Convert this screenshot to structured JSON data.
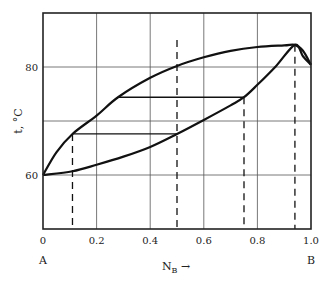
{
  "chart_data": {
    "type": "line",
    "title": "",
    "xlabel": "N_B →",
    "ylabel": "t, °C",
    "xlim": [
      0,
      1.0
    ],
    "ylim": [
      50,
      90
    ],
    "grid": true,
    "x_ticks": [
      "0",
      "0.2",
      "0.4",
      "0.6",
      "0.8",
      "1.0"
    ],
    "y_ticks": [
      "60",
      "80"
    ],
    "x_end_labels": {
      "left": "A",
      "right": "B"
    },
    "series": [
      {
        "name": "upper curve (vapor)",
        "style": "solid",
        "x": [
          0,
          0.05,
          0.11,
          0.2,
          0.28,
          0.4,
          0.5,
          0.6,
          0.7,
          0.8,
          0.9,
          0.94,
          0.97,
          1.0
        ],
        "y": [
          60,
          64.2,
          67.6,
          71.0,
          74.4,
          78.0,
          80.2,
          81.8,
          83.0,
          83.7,
          84.0,
          84.1,
          83.0,
          80.4
        ]
      },
      {
        "name": "lower curve (liquid)",
        "style": "solid",
        "x": [
          0,
          0.11,
          0.2,
          0.3,
          0.4,
          0.5,
          0.6,
          0.7,
          0.75,
          0.8,
          0.87,
          0.94,
          0.97,
          1.0
        ],
        "y": [
          60,
          60.7,
          61.9,
          63.4,
          65.2,
          67.6,
          70.2,
          72.9,
          74.4,
          76.7,
          80.2,
          84.1,
          82.0,
          80.4
        ]
      }
    ],
    "tie_lines": [
      {
        "x1": 0.11,
        "x2": 0.5,
        "y": 67.6
      },
      {
        "x1": 0.28,
        "x2": 0.75,
        "y": 74.4
      }
    ],
    "dashed_verticals": [
      {
        "x": 0.11,
        "y_top": 67.6
      },
      {
        "x": 0.5,
        "y_top": 85.0
      },
      {
        "x": 0.75,
        "y_top": 74.4
      },
      {
        "x": 0.94,
        "y_top": 84.1
      }
    ],
    "annotations": [
      "azeotrope maximum near N_B ≈ 0.94, t ≈ 84 °C"
    ]
  }
}
